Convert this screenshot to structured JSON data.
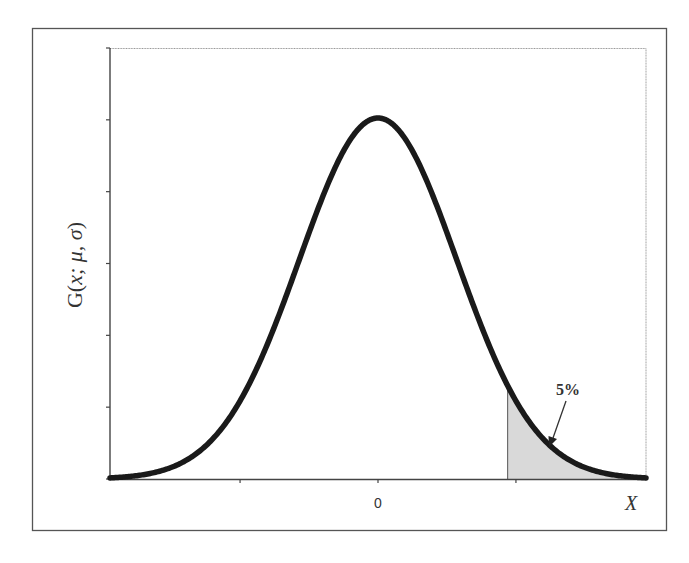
{
  "chart_data": {
    "type": "line",
    "title": "",
    "subtitle": "",
    "xlabel": "X",
    "ylabel": "G(x; μ, σ)",
    "ylabel_parts": {
      "prefix": "G(",
      "args": "x; μ, σ",
      "suffix": ")"
    },
    "x_tick_labels": [
      "",
      "0",
      ""
    ],
    "x_ticks_sigma": [
      -1.75,
      0,
      1.75
    ],
    "y_tick_count": 7,
    "y_tick_labels": [],
    "xlim_sigma": [
      -3.4,
      3.4
    ],
    "grid": false,
    "legend": null,
    "series": [
      {
        "name": "G(x; μ, σ)",
        "distribution": "normal",
        "mu": 0,
        "sigma": 1,
        "color": "#1a1a1a"
      }
    ],
    "shaded_region": {
      "from_sigma": 1.645,
      "to_sigma": 3.4,
      "tail": "upper",
      "fill": "#d9d9d9",
      "label": "5%"
    },
    "annotations": [
      {
        "text": "5%",
        "arrow_to": "shaded upper tail"
      }
    ]
  },
  "frame": {
    "outer_border_color": "#555555",
    "plot_border_color": "#888888"
  }
}
